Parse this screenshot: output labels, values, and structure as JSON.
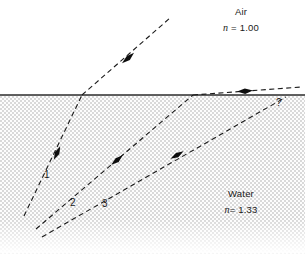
{
  "figure": {
    "width": 308,
    "height": 264,
    "background_color": "#ffffff",
    "line_color": "#1a1a1a",
    "water_fill_color": "#e8e8e8",
    "interface_color": "#333333"
  },
  "media": {
    "upper": {
      "name": "Air",
      "index_label": "n",
      "index_equals": "= 1.00",
      "index_value": 1.0
    },
    "lower": {
      "name": "Water",
      "index_label": "n",
      "index_equals": "= 1.33",
      "index_value": 1.33,
      "fill": "stipple"
    }
  },
  "interface": {
    "y": 95,
    "x_start": 0,
    "x_end": 305,
    "label": "air-water-interface"
  },
  "rays": [
    {
      "id": "ray-1",
      "tag": "1",
      "description": "Incident ray 1 refracting upward into air",
      "incident_points": [
        [
          24,
          216
        ],
        [
          82,
          95
        ]
      ],
      "refracted_points": [
        [
          82,
          95
        ],
        [
          170,
          18
        ]
      ],
      "arrow_in_water": [
        57,
        153
      ],
      "arrow_in_air": [
        128,
        58
      ],
      "refracts": true
    },
    {
      "id": "ray-2",
      "tag": "2",
      "description": "Incident ray 2 refracting to graze along the surface",
      "incident_points": [
        [
          36,
          229
        ],
        [
          193,
          95
        ]
      ],
      "refracted_points": [
        [
          193,
          95
        ],
        [
          302,
          87
        ]
      ],
      "arrow_in_water": [
        117,
        160
      ],
      "arrow_in_air": [
        245,
        91
      ],
      "refracts": true
    },
    {
      "id": "ray-3",
      "tag": "3",
      "description": "Incident ray 3 striking the surface, outcome unknown",
      "incident_points": [
        [
          42,
          237
        ],
        [
          286,
          97
        ]
      ],
      "refracted_points": [],
      "arrow_in_water": [
        177,
        155
      ],
      "arrow_in_air": null,
      "refracts": false
    }
  ],
  "annotations": {
    "unknown_ray": "?"
  }
}
